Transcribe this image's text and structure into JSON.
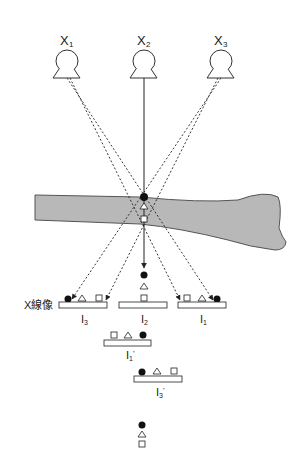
{
  "sources": [
    {
      "label": "X",
      "sub": "1",
      "cx": 67
    },
    {
      "label": "X",
      "sub": "2",
      "cx": 144
    },
    {
      "label": "X",
      "sub": "3",
      "cx": 221
    }
  ],
  "image_label": "X線像",
  "plates": {
    "I3": {
      "label": "I",
      "sub": "3",
      "prime": ""
    },
    "I2": {
      "label": "I",
      "sub": "2",
      "prime": ""
    },
    "I1": {
      "label": "I",
      "sub": "1",
      "prime": ""
    },
    "I1p": {
      "label": "I",
      "sub": "1",
      "prime": "'"
    },
    "I3p": {
      "label": "I",
      "sub": "3",
      "prime": "'"
    }
  },
  "colors": {
    "bone_fill": "#b8b8b8",
    "bone_stroke": "#555555",
    "line": "#222222"
  }
}
